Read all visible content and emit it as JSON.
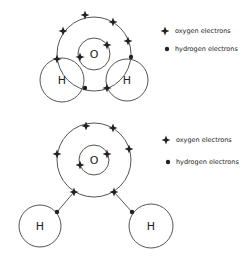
{
  "colors": {
    "stroke": "#555555",
    "electron": "#222222",
    "text": "#222222"
  },
  "diagrams": [
    {
      "id": "overlapping",
      "oxygen": {
        "label": "O",
        "cx": 94,
        "cy": 54,
        "outer_r": 37,
        "inner_r": 16
      },
      "hydrogens": [
        {
          "label": "H",
          "cx": 62,
          "cy": 80,
          "r": 22
        },
        {
          "label": "H",
          "cx": 127,
          "cy": 80,
          "r": 21
        }
      ],
      "oxygen_electrons": [
        [
          85,
          15
        ],
        [
          113,
          22
        ],
        [
          63,
          31
        ],
        [
          128,
          41
        ],
        [
          57,
          59
        ],
        [
          107,
          88
        ],
        [
          107,
          45
        ],
        [
          80,
          57
        ]
      ],
      "hydrogen_electrons": [
        [
          85,
          88
        ],
        [
          131,
          57
        ]
      ],
      "legend": {
        "oxygen_label": "oxygen electrons",
        "hydrogen_label": "hydrogen electrons"
      }
    },
    {
      "id": "separated",
      "oxygen": {
        "label": "O",
        "cx": 94,
        "cy": 160,
        "outer_r": 37,
        "inner_r": 15
      },
      "hydrogens": [
        {
          "label": "H",
          "cx": 40,
          "cy": 226,
          "r": 21
        },
        {
          "label": "H",
          "cx": 151,
          "cy": 226,
          "r": 22
        }
      ],
      "oxygen_electrons": [
        [
          86,
          126
        ],
        [
          113,
          128
        ],
        [
          57,
          154
        ],
        [
          129,
          149
        ],
        [
          74,
          192
        ],
        [
          114,
          192
        ],
        [
          107,
          154
        ],
        [
          80,
          165
        ]
      ],
      "hydrogen_electrons": [
        [
          57,
          212
        ],
        [
          132,
          212
        ]
      ],
      "legend": {
        "oxygen_label": "oxygen electrons",
        "hydrogen_label": "hydrogen electrons"
      }
    }
  ]
}
